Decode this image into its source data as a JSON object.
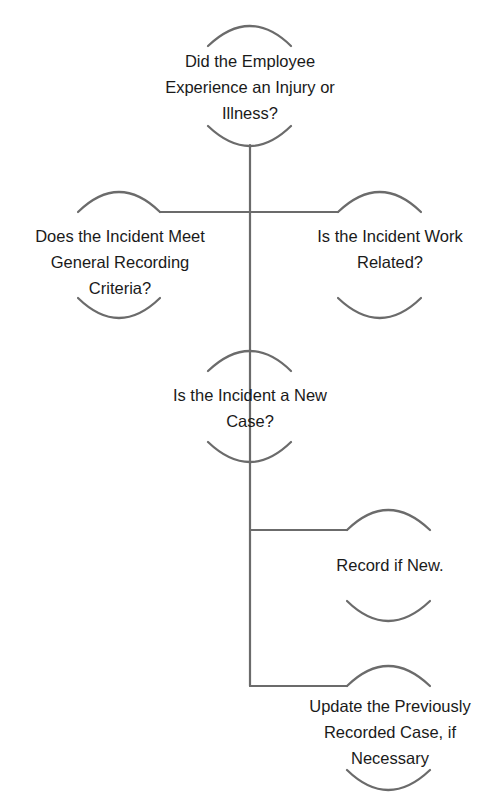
{
  "diagram": {
    "type": "decision-flowchart",
    "line_color": "#6b6b6b",
    "text_color": "#1a1a1a",
    "nodes": [
      {
        "id": "injury-or-illness",
        "lines": [
          "Did the Employee",
          "Experience an Injury or",
          "Illness?"
        ]
      },
      {
        "id": "general-recording-criteria",
        "lines": [
          "Does the Incident Meet",
          "General Recording",
          "Criteria?"
        ]
      },
      {
        "id": "work-related",
        "lines": [
          "Is the Incident Work",
          "Related?"
        ]
      },
      {
        "id": "new-case",
        "lines": [
          "Is the Incident a New",
          "Case?"
        ]
      },
      {
        "id": "record-if-new",
        "lines": [
          "Record if New."
        ]
      },
      {
        "id": "update-previous-case",
        "lines": [
          "Update the Previously",
          "Recorded Case, if",
          "Necessary"
        ]
      }
    ],
    "edges": [
      {
        "from": "injury-or-illness",
        "to": "general-recording-criteria"
      },
      {
        "from": "injury-or-illness",
        "to": "work-related"
      },
      {
        "from": "injury-or-illness",
        "to": "new-case"
      },
      {
        "from": "new-case",
        "to": "record-if-new"
      },
      {
        "from": "new-case",
        "to": "update-previous-case"
      }
    ]
  }
}
